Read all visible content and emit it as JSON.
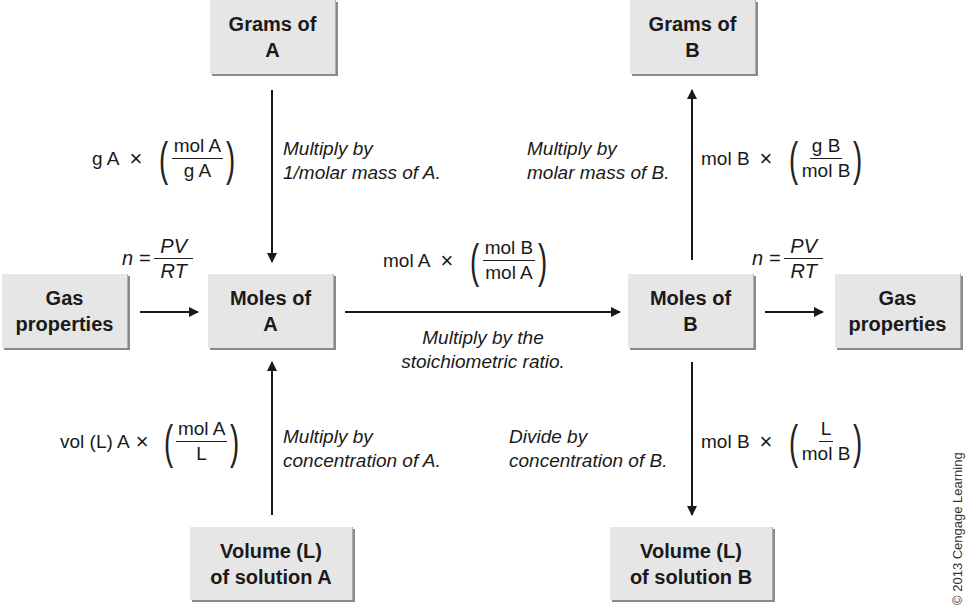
{
  "boxes": {
    "grams_a": {
      "line1": "Grams of",
      "line2": "A"
    },
    "grams_b": {
      "line1": "Grams of",
      "line2": "B"
    },
    "gas_left": {
      "line1": "Gas",
      "line2": "properties"
    },
    "moles_a": {
      "line1": "Moles of",
      "line2": "A"
    },
    "moles_b": {
      "line1": "Moles of",
      "line2": "B"
    },
    "gas_right": {
      "line1": "Gas",
      "line2": "properties"
    },
    "volume_a": {
      "line1": "Volume (L)",
      "line2": "of solution A"
    },
    "volume_b": {
      "line1": "Volume (L)",
      "line2": "of solution B"
    }
  },
  "conversions": {
    "grams_to_moles_a": {
      "prefix": "g A",
      "times": "×",
      "numerator": "mol A",
      "denominator": "g A",
      "desc1": "Multiply by",
      "desc2": "1/molar mass of A."
    },
    "moles_to_grams_b": {
      "prefix": "mol B",
      "times": "×",
      "numerator": "g B",
      "denominator": "mol B",
      "desc1": "Multiply by",
      "desc2": "molar mass of B."
    },
    "moles_a_to_moles_b": {
      "prefix": "mol A",
      "times": "×",
      "numerator": "mol B",
      "denominator": "mol A",
      "desc1": "Multiply by the",
      "desc2": "stoichiometric ratio."
    },
    "volume_to_moles_a": {
      "prefix": "vol (L) A",
      "times": "×",
      "numerator": "mol A",
      "denominator": "L",
      "desc1": "Multiply by",
      "desc2": "concentration of A."
    },
    "moles_to_volume_b": {
      "prefix": "mol B",
      "times": "×",
      "numerator": "L",
      "denominator": "mol B",
      "desc1": "Divide by",
      "desc2": "concentration of B."
    },
    "gas_left": {
      "lhs": "n =",
      "numerator": "PV",
      "denominator": "RT"
    },
    "gas_right": {
      "lhs": "n =",
      "numerator": "PV",
      "denominator": "RT"
    }
  },
  "copyright": "© 2013 Cengage Learning",
  "colors": {
    "box_fill": "#e6e6e6",
    "box_shadow": "#8a8a8a",
    "line": "#1a1a1a"
  }
}
